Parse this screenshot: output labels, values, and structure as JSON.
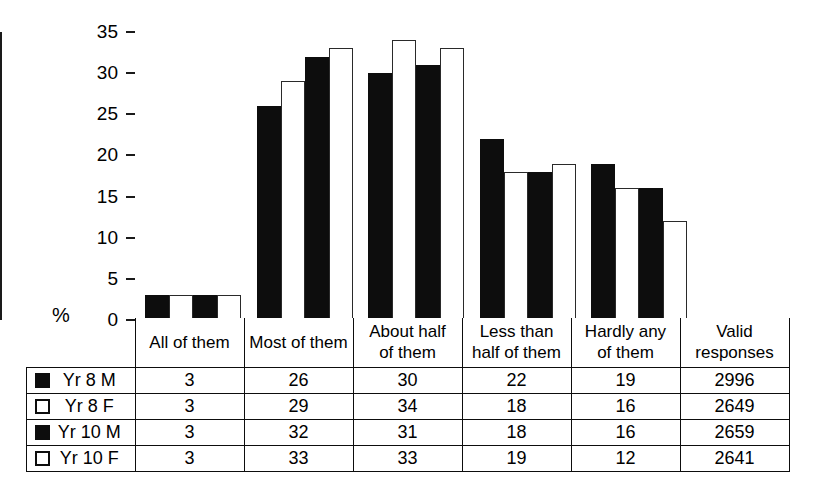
{
  "chart_data": {
    "type": "bar",
    "title": "",
    "xlabel": "",
    "ylabel": "%",
    "ylim": [
      0,
      35
    ],
    "yticks": [
      0,
      5,
      10,
      15,
      20,
      25,
      30,
      35
    ],
    "grid": false,
    "legend_position": "table-left",
    "categories": [
      "All of them",
      "Most of them",
      "About half of them",
      "Less than half of them",
      "Hardly any of them"
    ],
    "series": [
      {
        "name": "Yr 8 M",
        "fill": "black",
        "values": [
          3,
          26,
          30,
          22,
          19
        ],
        "valid_responses": 2996
      },
      {
        "name": "Yr 8 F",
        "fill": "white",
        "values": [
          3,
          29,
          34,
          18,
          16
        ],
        "valid_responses": 2649
      },
      {
        "name": "Yr 10 M",
        "fill": "black",
        "values": [
          3,
          32,
          31,
          18,
          16
        ],
        "valid_responses": 2659
      },
      {
        "name": "Yr 10 F",
        "fill": "white",
        "values": [
          3,
          33,
          33,
          19,
          12
        ],
        "valid_responses": 2641
      }
    ],
    "colors": {
      "black": "#0d0d0d",
      "white": "#ffffff",
      "outline": "#1a1a1a"
    }
  },
  "axis": {
    "y_unit_label": "%",
    "tick_labels": [
      "0",
      "5",
      "10",
      "15",
      "20",
      "25",
      "30",
      "35"
    ]
  },
  "table": {
    "headers": [
      {
        "line1": "All of them",
        "line2": ""
      },
      {
        "line1": "Most of them",
        "line2": ""
      },
      {
        "line1": "About half",
        "line2": "of them"
      },
      {
        "line1": "Less than",
        "line2": "half of them"
      },
      {
        "line1": "Hardly any",
        "line2": "of them"
      },
      {
        "line1": "Valid",
        "line2": "responses"
      }
    ],
    "rows": [
      {
        "swatch": "filled",
        "label": "Yr 8 M",
        "cells": [
          "3",
          "26",
          "30",
          "22",
          "19",
          "2996"
        ]
      },
      {
        "swatch": "hollow",
        "label": "Yr 8 F",
        "cells": [
          "3",
          "29",
          "34",
          "18",
          "16",
          "2649"
        ]
      },
      {
        "swatch": "filled",
        "label": "Yr 10 M",
        "cells": [
          "3",
          "32",
          "31",
          "18",
          "16",
          "2659"
        ]
      },
      {
        "swatch": "hollow",
        "label": "Yr 10 F",
        "cells": [
          "3",
          "33",
          "33",
          "19",
          "12",
          "2641"
        ]
      }
    ]
  }
}
